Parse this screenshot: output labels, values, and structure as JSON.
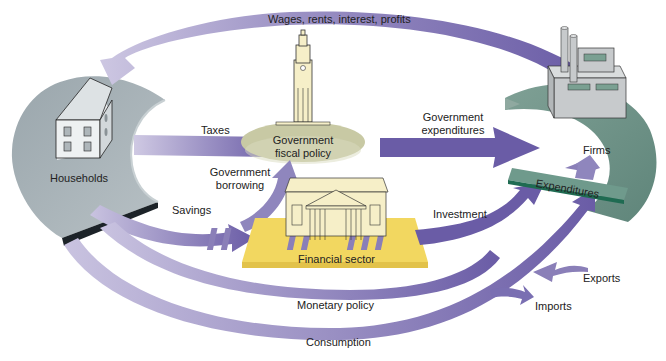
{
  "colors": {
    "flow_arrow": "#8a7fb8",
    "flow_arrow_dark": "#6a5ca6",
    "flow_arrow_light": "#c9c3e0",
    "households_base": "#a9b3b8",
    "firms_base": "#6f9288",
    "expenditures_bar": "#5e8d7e",
    "expenditures_edge": "#1f6b52",
    "government_ellipse": "#c8c9a4",
    "financial_platform": "#f2d760",
    "building_fill": "#f6efc8",
    "house_fill": "#e9ecee",
    "factory_fill": "#c7cacc"
  },
  "nodes": {
    "households": "Households",
    "firms": "Firms",
    "government": [
      "Government",
      "fiscal policy"
    ],
    "financial": "Financial sector",
    "expenditures": "Expenditures"
  },
  "flows": {
    "wages": "Wages, rents, interest, profits",
    "taxes": "Taxes",
    "gov_expenditures": [
      "Government",
      "expenditures"
    ],
    "gov_borrowing": [
      "Government",
      "borrowing"
    ],
    "savings": "Savings",
    "investment": "Investment",
    "monetary_policy": "Monetary policy",
    "consumption": "Consumption",
    "exports": "Exports",
    "imports": "Imports"
  }
}
